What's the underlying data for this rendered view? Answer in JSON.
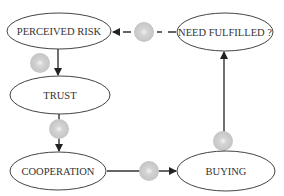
{
  "diagram": {
    "nodes": [
      {
        "id": "perceived-risk",
        "label": "PERCEIVED RISK",
        "cx": 59,
        "cy": 31,
        "rx": 52,
        "ry": 18
      },
      {
        "id": "need-fulfilled",
        "label": "NEED FULFILLED ?",
        "cx": 225,
        "cy": 32,
        "rx": 48,
        "ry": 19
      },
      {
        "id": "trust",
        "label": "TRUST",
        "cx": 60,
        "cy": 95,
        "rx": 50,
        "ry": 19
      },
      {
        "id": "cooperation",
        "label": "COOPERATION",
        "cx": 58,
        "cy": 171,
        "rx": 48,
        "ry": 19
      },
      {
        "id": "buying",
        "label": "BUYING",
        "cx": 226,
        "cy": 171,
        "rx": 49,
        "ry": 20
      }
    ],
    "edges": [
      {
        "from": "need-fulfilled",
        "to": "perceived-risk",
        "style": "dashed"
      },
      {
        "from": "perceived-risk",
        "to": "trust",
        "style": "solid"
      },
      {
        "from": "trust",
        "to": "cooperation",
        "style": "solid"
      },
      {
        "from": "cooperation",
        "to": "buying",
        "style": "solid"
      },
      {
        "from": "buying",
        "to": "need-fulfilled",
        "style": "solid"
      }
    ],
    "markers": [
      {
        "id": "marker-feedback",
        "cx": 144,
        "cy": 32
      },
      {
        "id": "marker-risk-trust",
        "cx": 40,
        "cy": 63
      },
      {
        "id": "marker-trust-coop",
        "cx": 59,
        "cy": 129
      },
      {
        "id": "marker-coop-buying",
        "cx": 149,
        "cy": 171
      },
      {
        "id": "marker-buying-need",
        "cx": 223,
        "cy": 141
      }
    ],
    "colors": {
      "stroke": "#333333",
      "marker": "#c8c8c8",
      "marker_center": "#e6e6e6"
    }
  }
}
